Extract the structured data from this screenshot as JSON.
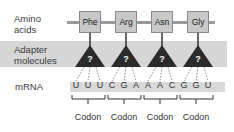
{
  "labels": {
    "amino_acids": [
      "Amino",
      "acids"
    ],
    "adapter": [
      "Adapter",
      "molecules"
    ],
    "mrna": "mRNA"
  },
  "amino_acids": [
    {
      "name": "Phe"
    },
    {
      "name": "Arg"
    },
    {
      "name": "Asn"
    },
    {
      "name": "Gly"
    }
  ],
  "adapters": [
    {
      "symbol": "?"
    },
    {
      "symbol": "?"
    },
    {
      "symbol": "?"
    },
    {
      "symbol": "?"
    }
  ],
  "mrna_bases": [
    "U",
    "U",
    "U",
    "C",
    "G",
    "A",
    "A",
    "A",
    "C",
    "G",
    "G",
    "U"
  ],
  "codons": [
    {
      "label": "Codon",
      "bases": "UUU"
    },
    {
      "label": "Codon",
      "bases": "CGA"
    },
    {
      "label": "Codon",
      "bases": "AAC"
    },
    {
      "label": "Codon",
      "bases": "GGU"
    }
  ],
  "colors": {
    "box_fill": "#c8c8c8",
    "band_fill": "#d6d6d6",
    "triangle_fill": "#2b2b2b",
    "mrna_fill": "#d8d8d8"
  }
}
